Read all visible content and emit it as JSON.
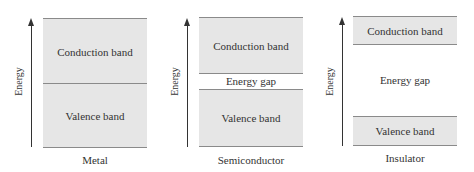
{
  "diagram": {
    "panels": [
      {
        "name": "Metal",
        "ylabel": "Energy",
        "conduction": "Conduction band",
        "valence": "Valence band",
        "gap": null,
        "caption": "Metal"
      },
      {
        "name": "Semiconductor",
        "ylabel": "Energy",
        "conduction": "Conduction band",
        "valence": "Valence band",
        "gap": "Energy gap",
        "caption": "Semiconductor"
      },
      {
        "name": "Insulator",
        "ylabel": "Energy",
        "conduction": "Conduction band",
        "valence": "Valence band",
        "gap": "Energy gap",
        "caption": "Insulator"
      }
    ],
    "colors": {
      "band_fill": "#e6e6e6",
      "band_border": "#8a8a8a",
      "text": "#333333"
    }
  }
}
